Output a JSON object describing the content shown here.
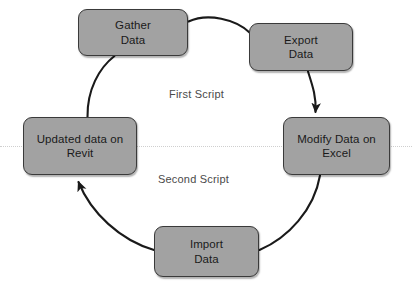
{
  "diagram": {
    "type": "cycle-flowchart",
    "background_color": "#ffffff",
    "node_fill_color": "#a2a2a2",
    "node_border_color": "#3a3a3a",
    "arc_color": "#1a1a1a",
    "label_color": "#4a4a4a",
    "divider_color": "#cfcfcf",
    "nodes": [
      {
        "id": "gather-data",
        "label": "Gather\nData",
        "x": 78,
        "y": 9,
        "width": 110,
        "height": 47
      },
      {
        "id": "export-data",
        "label": "Export\nData",
        "x": 249,
        "y": 23,
        "width": 104,
        "height": 48
      },
      {
        "id": "modify-data-on-excel",
        "label": "Modify Data on\nExcel",
        "x": 283,
        "y": 117,
        "width": 107,
        "height": 58
      },
      {
        "id": "import-data",
        "label": "Import\nData",
        "x": 154,
        "y": 226,
        "width": 105,
        "height": 51
      },
      {
        "id": "updated-data-on-revit",
        "label": "Updated data on\nRevit",
        "x": 23,
        "y": 117,
        "width": 114,
        "height": 58
      }
    ],
    "script_labels": [
      {
        "id": "first-script",
        "text": "First Script",
        "x": 169,
        "y": 88
      },
      {
        "id": "second-script",
        "text": "Second Script",
        "x": 158,
        "y": 173
      }
    ],
    "divider": {
      "id": "horizontal-dotted-divider",
      "y": 146
    },
    "connectors": [
      {
        "id": "gather-to-export",
        "from": "gather-data",
        "to": "export-data",
        "arrowhead": false
      },
      {
        "id": "export-to-modify",
        "from": "export-data",
        "to": "modify-data-on-excel",
        "arrowhead": true
      },
      {
        "id": "modify-to-import",
        "from": "modify-data-on-excel",
        "to": "import-data",
        "arrowhead": false
      },
      {
        "id": "import-to-updated",
        "from": "import-data",
        "to": "updated-data-on-revit",
        "arrowhead": true
      },
      {
        "id": "updated-to-gather",
        "from": "updated-data-on-revit",
        "to": "gather-data",
        "arrowhead": false
      }
    ]
  }
}
